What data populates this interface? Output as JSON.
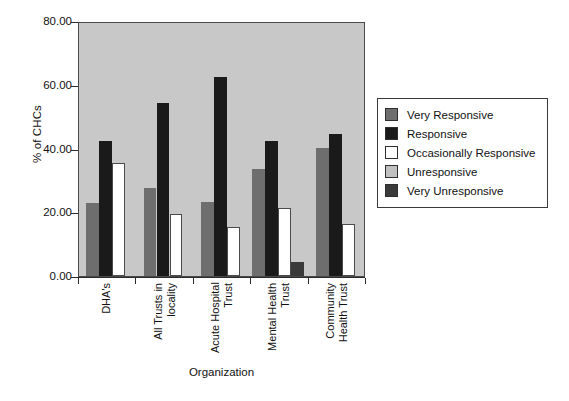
{
  "chart_data": {
    "type": "bar",
    "title": "",
    "xlabel": "Organization",
    "ylabel": "% of CHCs",
    "ylim": [
      0,
      80
    ],
    "yticks": [
      "0.00",
      "20.00",
      "40.00",
      "60.00",
      "80.00"
    ],
    "ytick_values": [
      0,
      20,
      40,
      60,
      80
    ],
    "grid": false,
    "legend_position": "right",
    "categories": [
      "DHA's",
      "All Trusts in\nlocality",
      "Acute Hospital\nTrust",
      "Mental Health\nTrust",
      "Community\nHealth Trust"
    ],
    "series": [
      {
        "name": "Very Responsive",
        "color": "#6e6e6e",
        "values": [
          23.0,
          27.5,
          23.3,
          33.5,
          40.3
        ]
      },
      {
        "name": "Responsive",
        "color": "#1a1a1a",
        "values": [
          42.5,
          54.3,
          62.3,
          42.5,
          44.5
        ]
      },
      {
        "name": "Occasionally Responsive",
        "color": "#ffffff",
        "values": [
          35.5,
          19.3,
          15.3,
          21.3,
          16.3
        ]
      },
      {
        "name": "Unresponsive",
        "color": "#c0c0c0",
        "values": [
          0,
          0,
          0,
          0,
          0
        ]
      },
      {
        "name": "Very Unresponsive",
        "color": "#3a3a3a",
        "values": [
          0,
          0,
          0,
          4.5,
          0
        ]
      }
    ]
  },
  "axes": {
    "y_title": "% of CHCs",
    "x_title": "Organization"
  },
  "legend": {
    "items": [
      {
        "label": "Very Responsive",
        "color": "#6e6e6e"
      },
      {
        "label": "Responsive",
        "color": "#1a1a1a"
      },
      {
        "label": "Occasionally Responsive",
        "color": "#ffffff"
      },
      {
        "label": "Unresponsive",
        "color": "#c0c0c0"
      },
      {
        "label": "Very Unresponsive",
        "color": "#3a3a3a"
      }
    ]
  },
  "colors": {
    "plot_background": "#c8c8c8",
    "page_background": "#ffffff",
    "axis": "#2b2b2b"
  }
}
